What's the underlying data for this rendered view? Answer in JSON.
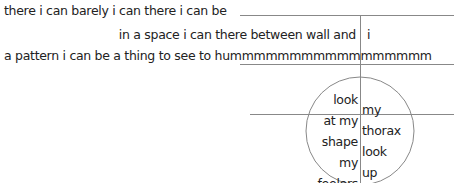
{
  "poem": {
    "lines": [
      "there i can barely i can there i can be",
      "in a space i can there between wall and",
      "i",
      "a pattern i can be a thing to see to hummmmmmmmmmmmmmmmm"
    ],
    "circle_left": [
      "look",
      "at my",
      "shape",
      "my",
      "feelers"
    ],
    "circle_right": [
      "my",
      "thorax",
      "look",
      "up"
    ]
  },
  "colors": {
    "text": "#222222",
    "rule": "#888888"
  }
}
